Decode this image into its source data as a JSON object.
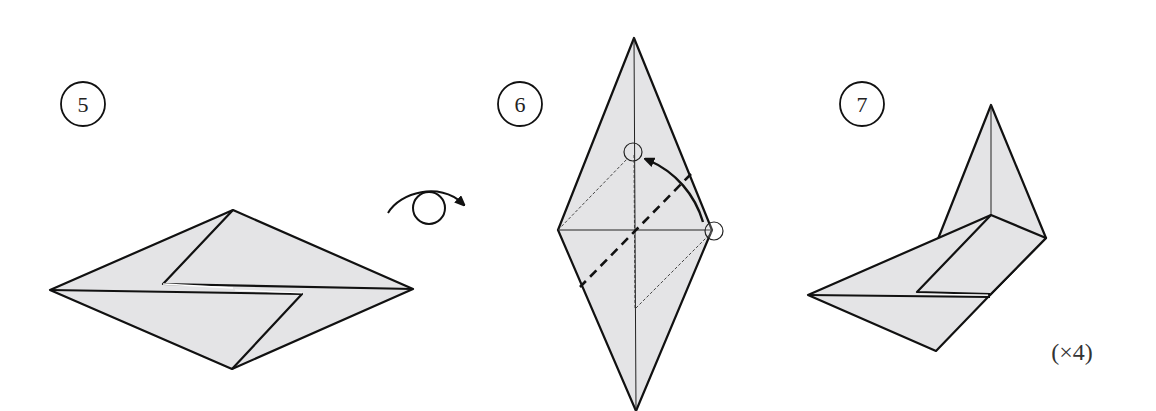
{
  "diagram": {
    "type": "origami-instructions",
    "steps": [
      {
        "number": "5",
        "description": "Flattened diamond with two offset flaps; turn model over"
      },
      {
        "number": "6",
        "description": "Valley fold right corner up to marked point on center line"
      },
      {
        "number": "7",
        "description": "Result after fold",
        "repeat_label": "(×4)"
      }
    ],
    "symbols": {
      "turn_over": "turn-over arrow",
      "fold_arrow": "curved fold arrow",
      "reference_points": "small circles marking start and target points"
    },
    "colors": {
      "paper": "#e4e4e6",
      "line": "#111111",
      "background": "#ffffff"
    }
  }
}
